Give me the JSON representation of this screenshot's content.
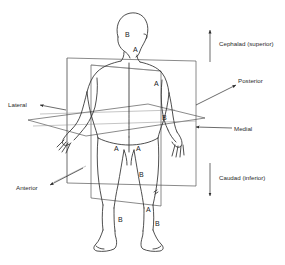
{
  "figure": {
    "view": "posterior view of human body",
    "line_color": "#2f2f2f",
    "plane_color": "#4a4a4a",
    "text_color": "#2b2b2b",
    "background": "#ffffff"
  },
  "direction_labels": [
    {
      "id": "cephalad",
      "text": "Cephalad (superior)",
      "marker": "up-arrow"
    },
    {
      "id": "posterior",
      "text": "Posterior",
      "marker": "leader-arrow"
    },
    {
      "id": "medial",
      "text": "Medial",
      "marker": "leader-arrow"
    },
    {
      "id": "caudad",
      "text": "Caudad (inferior)",
      "marker": "down-arrow"
    },
    {
      "id": "lateral",
      "text": "Lateral",
      "marker": "leader-arrow"
    },
    {
      "id": "anterior",
      "text": "Anterior",
      "marker": "leader-arrow"
    }
  ],
  "region_markers": [
    {
      "id": "head",
      "text": "B"
    },
    {
      "id": "neck",
      "text": "A"
    },
    {
      "id": "upper-arm-right",
      "text": "A"
    },
    {
      "id": "forearm-right",
      "text": "B"
    },
    {
      "id": "thigh-left",
      "text": "A"
    },
    {
      "id": "thigh-right",
      "text": "A"
    },
    {
      "id": "knee-center",
      "text": "B"
    },
    {
      "id": "shin-right",
      "text": "A"
    },
    {
      "id": "calf-left",
      "text": "B"
    },
    {
      "id": "calf-right",
      "text": "B"
    }
  ],
  "planes": [
    {
      "id": "frontal-plane",
      "name": "frontal (coronal) plane"
    },
    {
      "id": "sagittal-plane",
      "name": "sagittal (median) plane"
    },
    {
      "id": "horizontal-plane",
      "name": "horizontal (transverse) plane"
    }
  ]
}
